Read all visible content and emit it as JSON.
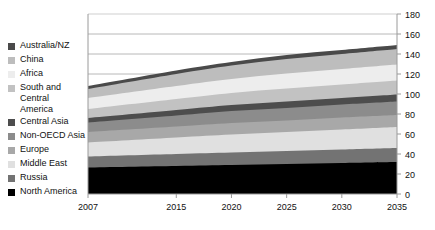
{
  "chart_data": {
    "type": "area",
    "stacked": true,
    "title": "",
    "xlabel": "",
    "ylabel": "",
    "x": [
      2007,
      2015,
      2020,
      2025,
      2030,
      2035
    ],
    "x_tick_labels": [
      "2007",
      "2015",
      "2020",
      "2025",
      "2030",
      "2035"
    ],
    "xlim": [
      2007,
      2035
    ],
    "ylim": [
      0,
      180
    ],
    "y_tick_labels": [
      "0",
      "20",
      "40",
      "60",
      "80",
      "100",
      "120",
      "140",
      "160",
      "180"
    ],
    "y_ticks": [
      0,
      20,
      40,
      60,
      80,
      100,
      120,
      140,
      160,
      180
    ],
    "y_axis_position": "right",
    "grid": true,
    "legend_position": "left",
    "series": [
      {
        "name": "North America",
        "color": "#000000",
        "values": [
          26.5,
          28.0,
          29.0,
          30.0,
          31.0,
          32.0
        ]
      },
      {
        "name": "Russia",
        "color": "#737373",
        "values": [
          11.0,
          12.0,
          12.5,
          13.0,
          13.5,
          14.0
        ]
      },
      {
        "name": "Middle East",
        "color": "#e0e0e0",
        "values": [
          14.0,
          16.5,
          18.0,
          19.0,
          20.0,
          21.0
        ]
      },
      {
        "name": "Europe",
        "color": "#a8a8a8",
        "values": [
          10.5,
          11.0,
          11.5,
          11.5,
          12.0,
          12.0
        ]
      },
      {
        "name": "Non-OECD Asia",
        "color": "#8c8c8c",
        "values": [
          9.5,
          11.0,
          12.0,
          12.5,
          13.0,
          13.5
        ]
      },
      {
        "name": "Central Asia",
        "color": "#4d4d4d",
        "values": [
          4.5,
          5.5,
          6.0,
          6.5,
          6.5,
          7.0
        ]
      },
      {
        "name": "South and Central America",
        "color": "#c2c2c2",
        "values": [
          9.0,
          11.0,
          12.0,
          13.0,
          13.5,
          14.0
        ]
      },
      {
        "name": "Africa",
        "color": "#ededed",
        "values": [
          11.0,
          13.0,
          14.0,
          15.0,
          15.5,
          16.0
        ]
      },
      {
        "name": "China",
        "color": "#bdbdbd",
        "values": [
          9.0,
          12.0,
          13.5,
          14.5,
          15.0,
          15.5
        ]
      },
      {
        "name": "Australia/NZ",
        "color": "#4a4a4a",
        "values": [
          3.0,
          3.5,
          3.5,
          4.0,
          4.0,
          4.0
        ]
      }
    ],
    "legend_entries": [
      {
        "label": "Australia/NZ",
        "color": "#4a4a4a"
      },
      {
        "label": "China",
        "color": "#bdbdbd"
      },
      {
        "label": "Africa",
        "color": "#ededed"
      },
      {
        "label": "South and Central\nAmerica",
        "color": "#c2c2c2"
      },
      {
        "label": "Central Asia",
        "color": "#4d4d4d"
      },
      {
        "label": "Non-OECD Asia",
        "color": "#8c8c8c"
      },
      {
        "label": "Europe",
        "color": "#a8a8a8"
      },
      {
        "label": "Middle East",
        "color": "#e0e0e0"
      },
      {
        "label": "Russia",
        "color": "#737373"
      },
      {
        "label": "North America",
        "color": "#000000"
      }
    ]
  }
}
